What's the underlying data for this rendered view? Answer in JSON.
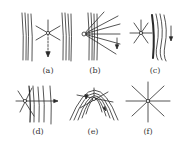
{
  "figure": {
    "stroke_color": "#2a2a2a",
    "background": "#ffffff",
    "panels": [
      {
        "id": "a",
        "label": "(a)",
        "description": "star between two parallel line bundles, arrow downward"
      },
      {
        "id": "b",
        "label": "(b)",
        "description": "fan of rays from point on left of line bundle, arrow downward"
      },
      {
        "id": "c",
        "label": "(c)",
        "description": "star to left of wavy line bundle, arrow downward"
      },
      {
        "id": "d",
        "label": "(d)",
        "description": "star overlapping vertical lines, horizontal arrow right"
      },
      {
        "id": "e",
        "label": "(e)",
        "description": "star inside nested parabolic curves with arrows"
      },
      {
        "id": "f",
        "label": "(f)",
        "description": "eight-ray star alone"
      }
    ]
  }
}
